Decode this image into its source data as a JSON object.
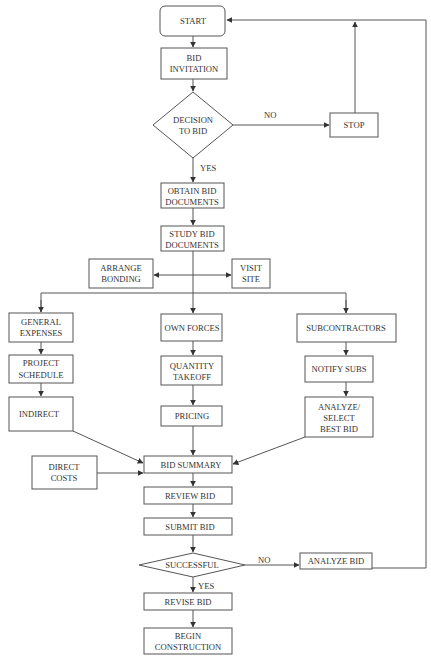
{
  "diagram": {
    "type": "flowchart",
    "title": "",
    "nodes": {
      "start": {
        "shape": "rounded-rect",
        "lines": [
          "START"
        ]
      },
      "bid_invitation": {
        "shape": "rect",
        "lines": [
          "BID",
          "INVITATION"
        ]
      },
      "decision_to_bid": {
        "shape": "diamond",
        "lines": [
          "DECISION",
          "TO BID"
        ]
      },
      "stop": {
        "shape": "rect",
        "lines": [
          "STOP"
        ]
      },
      "obtain_bid_documents": {
        "shape": "rect",
        "lines": [
          "OBTAIN BID",
          "DOCUMENTS"
        ]
      },
      "study_bid_documents": {
        "shape": "rect",
        "lines": [
          "STUDY BID",
          "DOCUMENTS"
        ]
      },
      "arrange_bonding": {
        "shape": "rect",
        "lines": [
          "ARRANGE",
          "BONDING"
        ]
      },
      "visit_site": {
        "shape": "rect",
        "lines": [
          "VISIT",
          "SITE"
        ]
      },
      "general_expenses": {
        "shape": "rect",
        "lines": [
          "GENERAL",
          "EXPENSES"
        ]
      },
      "project_schedule": {
        "shape": "rect",
        "lines": [
          "PROJECT",
          "SCHEDULE"
        ]
      },
      "indirect": {
        "shape": "rect",
        "lines": [
          "INDIRECT"
        ]
      },
      "own_forces": {
        "shape": "rect",
        "lines": [
          "OWN FORCES"
        ]
      },
      "quantity_takeoff": {
        "shape": "rect",
        "lines": [
          "QUANTITY",
          "TAKEOFF"
        ]
      },
      "pricing": {
        "shape": "rect",
        "lines": [
          "PRICING"
        ]
      },
      "subcontractors": {
        "shape": "rect",
        "lines": [
          "SUBCONTRACTORS"
        ]
      },
      "notify_subs": {
        "shape": "rect",
        "lines": [
          "NOTIFY SUBS"
        ]
      },
      "analyze_select_best_bid": {
        "shape": "rect",
        "lines": [
          "ANALYZE/",
          "SELECT",
          "BEST BID"
        ]
      },
      "direct_costs": {
        "shape": "rect",
        "lines": [
          "DIRECT",
          "COSTS"
        ]
      },
      "bid_summary": {
        "shape": "rect",
        "lines": [
          "BID SUMMARY"
        ]
      },
      "review_bid": {
        "shape": "rect",
        "lines": [
          "REVIEW BID"
        ]
      },
      "submit_bid": {
        "shape": "rect",
        "lines": [
          "SUBMIT BID"
        ]
      },
      "successful": {
        "shape": "diamond",
        "lines": [
          "SUCCESSFUL"
        ]
      },
      "analyze_bid": {
        "shape": "rect",
        "lines": [
          "ANALYZE BID"
        ]
      },
      "revise_bid": {
        "shape": "rect",
        "lines": [
          "REVISE BID"
        ]
      },
      "begin_construction": {
        "shape": "rect",
        "lines": [
          "BEGIN",
          "CONSTRUCTION"
        ]
      }
    },
    "edge_labels": {
      "decision_no": "NO",
      "decision_yes": "YES",
      "successful_no": "NO",
      "successful_yes": "YES"
    },
    "edges": [
      {
        "from": "START",
        "to": "BID INVITATION"
      },
      {
        "from": "BID INVITATION",
        "to": "DECISION TO BID"
      },
      {
        "from": "DECISION TO BID",
        "to": "STOP",
        "label": "NO"
      },
      {
        "from": "STOP",
        "to": "START"
      },
      {
        "from": "DECISION TO BID",
        "to": "OBTAIN BID DOCUMENTS",
        "label": "YES"
      },
      {
        "from": "OBTAIN BID DOCUMENTS",
        "to": "STUDY BID DOCUMENTS"
      },
      {
        "from": "STUDY BID DOCUMENTS",
        "to": "ARRANGE BONDING"
      },
      {
        "from": "STUDY BID DOCUMENTS",
        "to": "VISIT SITE"
      },
      {
        "from": "STUDY BID DOCUMENTS",
        "to": "GENERAL EXPENSES"
      },
      {
        "from": "STUDY BID DOCUMENTS",
        "to": "OWN FORCES"
      },
      {
        "from": "STUDY BID DOCUMENTS",
        "to": "SUBCONTRACTORS"
      },
      {
        "from": "GENERAL EXPENSES",
        "to": "PROJECT SCHEDULE"
      },
      {
        "from": "PROJECT SCHEDULE",
        "to": "INDIRECT"
      },
      {
        "from": "INDIRECT",
        "to": "BID SUMMARY"
      },
      {
        "from": "OWN FORCES",
        "to": "QUANTITY TAKEOFF"
      },
      {
        "from": "QUANTITY TAKEOFF",
        "to": "PRICING"
      },
      {
        "from": "PRICING",
        "to": "BID SUMMARY"
      },
      {
        "from": "SUBCONTRACTORS",
        "to": "NOTIFY SUBS"
      },
      {
        "from": "NOTIFY SUBS",
        "to": "ANALYZE/SELECT BEST BID"
      },
      {
        "from": "ANALYZE/SELECT BEST BID",
        "to": "BID SUMMARY"
      },
      {
        "from": "DIRECT COSTS",
        "to": "BID SUMMARY"
      },
      {
        "from": "BID SUMMARY",
        "to": "REVIEW BID"
      },
      {
        "from": "REVIEW BID",
        "to": "SUBMIT BID"
      },
      {
        "from": "SUBMIT BID",
        "to": "SUCCESSFUL"
      },
      {
        "from": "SUCCESSFUL",
        "to": "ANALYZE BID",
        "label": "NO"
      },
      {
        "from": "ANALYZE BID",
        "to": "START"
      },
      {
        "from": "SUCCESSFUL",
        "to": "REVISE BID",
        "label": "YES"
      },
      {
        "from": "REVISE BID",
        "to": "BEGIN CONSTRUCTION"
      }
    ]
  },
  "colors": {
    "stroke": "#555555",
    "text": "#333333",
    "background": "#ffffff"
  }
}
